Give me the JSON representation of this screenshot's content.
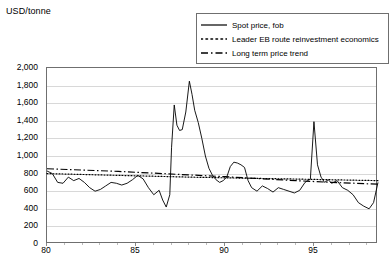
{
  "chart": {
    "axis_title": "USD/tonne"
  },
  "legend": {
    "items": [
      {
        "label": "Spot price, fob",
        "style": "solid",
        "color": "#000000"
      },
      {
        "label": "Leader EB route reinvestment economics",
        "style": "dotted",
        "color": "#000000"
      },
      {
        "label": "Long term price trend",
        "style": "dashdot",
        "color": "#000000"
      }
    ]
  },
  "chart_data": {
    "type": "line",
    "title": "",
    "xlabel": "",
    "ylabel": "USD/tonne",
    "ylim": [
      0,
      2000
    ],
    "ytick_labels": [
      "0",
      "200",
      "400",
      "600",
      "800",
      "1,000",
      "1,200",
      "1,400",
      "1,600",
      "1,800",
      "2,000"
    ],
    "ytick_values": [
      0,
      200,
      400,
      600,
      800,
      1000,
      1200,
      1400,
      1600,
      1800,
      2000
    ],
    "xlim": [
      1980,
      1998.6
    ],
    "xtick_labels": [
      "80",
      "85",
      "90",
      "95"
    ],
    "xtick_values": [
      1980,
      1985,
      1990,
      1995
    ],
    "grid": "horizontal",
    "legend_position": "top-right",
    "series": [
      {
        "name": "Spot price, fob",
        "style": "solid",
        "x": [
          1980.0,
          1980.3,
          1980.6,
          1980.9,
          1981.2,
          1981.5,
          1981.8,
          1982.1,
          1982.4,
          1982.7,
          1983.0,
          1983.3,
          1983.6,
          1983.9,
          1984.2,
          1984.5,
          1984.8,
          1985.1,
          1985.4,
          1985.7,
          1986.0,
          1986.3,
          1986.5,
          1986.7,
          1986.9,
          1987.0,
          1987.15,
          1987.3,
          1987.45,
          1987.6,
          1987.8,
          1988.0,
          1988.15,
          1988.3,
          1988.5,
          1988.7,
          1988.9,
          1989.1,
          1989.3,
          1989.5,
          1989.7,
          1989.9,
          1990.1,
          1990.3,
          1990.5,
          1990.7,
          1990.9,
          1991.1,
          1991.3,
          1991.5,
          1991.8,
          1992.1,
          1992.4,
          1992.7,
          1993.0,
          1993.3,
          1993.6,
          1993.9,
          1994.2,
          1994.5,
          1994.8,
          1995.0,
          1995.2,
          1995.4,
          1995.6,
          1995.8,
          1996.0,
          1996.3,
          1996.6,
          1996.9,
          1997.2,
          1997.5,
          1997.8,
          1998.1,
          1998.35,
          1998.6
        ],
        "y": [
          830,
          800,
          700,
          690,
          760,
          720,
          745,
          700,
          640,
          600,
          620,
          660,
          700,
          690,
          670,
          690,
          730,
          780,
          740,
          640,
          560,
          610,
          500,
          420,
          560,
          1100,
          1580,
          1350,
          1290,
          1300,
          1500,
          1850,
          1700,
          1520,
          1380,
          1200,
          1000,
          860,
          780,
          730,
          700,
          720,
          760,
          880,
          930,
          920,
          900,
          870,
          720,
          640,
          600,
          660,
          630,
          590,
          640,
          620,
          600,
          580,
          610,
          700,
          740,
          1390,
          900,
          760,
          700,
          730,
          690,
          720,
          640,
          610,
          560,
          470,
          430,
          400,
          470,
          700
        ]
      },
      {
        "name": "Leader EB route reinvestment economics",
        "style": "dotted",
        "x": [
          1980.0,
          1982.0,
          1984.0,
          1986.0,
          1988.0,
          1990.0,
          1992.0,
          1994.0,
          1996.0,
          1998.6
        ],
        "y": [
          800,
          790,
          780,
          770,
          760,
          752,
          745,
          738,
          730,
          720
        ]
      },
      {
        "name": "Long term price trend",
        "style": "dashdot",
        "x": [
          1980.0,
          1982.0,
          1984.0,
          1986.0,
          1988.0,
          1990.0,
          1992.0,
          1994.0,
          1996.0,
          1998.6
        ],
        "y": [
          855,
          840,
          825,
          805,
          785,
          765,
          742,
          720,
          700,
          680
        ]
      }
    ]
  }
}
